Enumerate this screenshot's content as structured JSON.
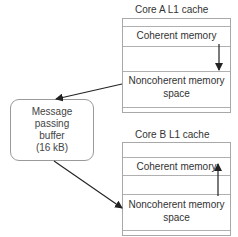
{
  "diagram": {
    "core_a": {
      "title": "Core A L1 cache",
      "coherent_label": "Coherent memory",
      "noncoherent_label_line1": "Noncoherent memory",
      "noncoherent_label_line2": "space",
      "arrow_direction": "down"
    },
    "core_b": {
      "title": "Core B L1 cache",
      "coherent_label": "Coherent memory",
      "noncoherent_label_line1": "Noncoherent memory",
      "noncoherent_label_line2": "space",
      "arrow_direction": "up"
    },
    "buffer": {
      "line1": "Message",
      "line2": "passing",
      "line3": "buffer",
      "line4": "(16 kB)"
    },
    "edges": [
      {
        "from": "core_a.noncoherent",
        "to": "buffer"
      },
      {
        "from": "buffer",
        "to": "core_b.noncoherent"
      }
    ],
    "colors": {
      "stroke": "#222222",
      "box_border": "#a8a8a8",
      "text": "#333333"
    }
  }
}
